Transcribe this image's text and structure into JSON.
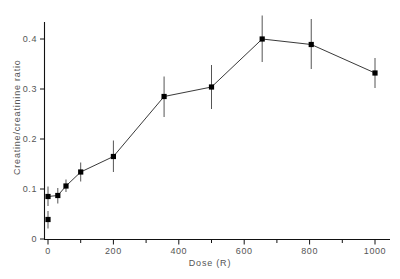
{
  "chart_data": {
    "type": "scatter",
    "title": "",
    "xlabel": "Dose (R)",
    "ylabel": "Creatine/creatinine ratio",
    "xlim": [
      0,
      1040
    ],
    "ylim": [
      0,
      0.45
    ],
    "grid": false,
    "legend": null,
    "xticks": [
      0,
      200,
      400,
      600,
      800,
      1000
    ],
    "xtick_labels": [
      "0",
      "200",
      "400",
      "600",
      "800",
      "1000"
    ],
    "xminor_ticks": [
      100,
      300,
      500,
      700,
      900
    ],
    "yticks": [
      0,
      0.1,
      0.2,
      0.3,
      0.4
    ],
    "ytick_labels": [
      "0",
      "0.1",
      "0.2",
      "0.3",
      "0.4"
    ],
    "marker": "square",
    "marker_color": "#000000",
    "line_color": "#222222",
    "errorbar_color": "#555555",
    "series": [
      {
        "name": "Creatine/creatinine ratio",
        "x": [
          0,
          0,
          30,
          55,
          100,
          200,
          355,
          500,
          655,
          805,
          1000
        ],
        "y": [
          0.085,
          0.039,
          0.087,
          0.106,
          0.134,
          0.165,
          0.285,
          0.304,
          0.4,
          0.389,
          0.332
        ],
        "yerr_low": [
          0.019,
          0.018,
          0.016,
          0.012,
          0.019,
          0.031,
          0.041,
          0.044,
          0.046,
          0.049,
          0.03
        ],
        "yerr_high": [
          0.02,
          0.017,
          0.015,
          0.013,
          0.019,
          0.032,
          0.04,
          0.044,
          0.047,
          0.051,
          0.03
        ]
      }
    ],
    "connected_indices": [
      0,
      2,
      3,
      4,
      5,
      6,
      7,
      8,
      9,
      10
    ]
  }
}
